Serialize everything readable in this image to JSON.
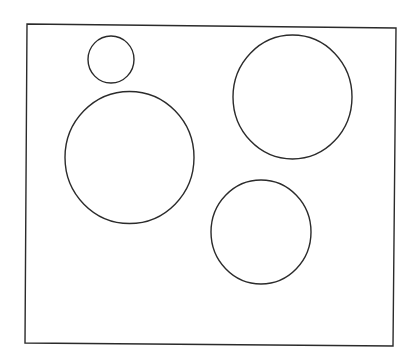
{
  "diagram": {
    "background": "#ffffff",
    "stroke_color": "#2b2b2b",
    "stroke_width": 1.4,
    "frame": {
      "points": [
        [
          27,
          24
        ],
        [
          396,
          28
        ],
        [
          393,
          346
        ],
        [
          25,
          343
        ]
      ]
    },
    "circles": [
      {
        "name": "small-circle-top-left",
        "cx": 111,
        "cy": 59.5,
        "rx": 23,
        "ry": 23.5
      },
      {
        "name": "large-circle-left",
        "cx": 129.5,
        "cy": 157.5,
        "rx": 64.5,
        "ry": 66
      },
      {
        "name": "large-circle-upper-right",
        "cx": 292.5,
        "cy": 97,
        "rx": 59.5,
        "ry": 62
      },
      {
        "name": "medium-circle-lower-right",
        "cx": 261,
        "cy": 232,
        "rx": 50,
        "ry": 52
      }
    ]
  }
}
